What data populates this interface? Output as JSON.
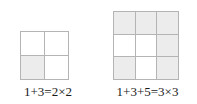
{
  "figure": {
    "colors": {
      "shaded_cell": "#ececec",
      "empty_cell": "#ffffff",
      "grid_line": "#b4b4b4",
      "text": "#1a1a1a",
      "background": "#ffffff"
    },
    "panels": [
      {
        "id": "panel-2x2",
        "name": "two-by-two-square",
        "rows": 2,
        "cols": 2,
        "cells": [
          {
            "row": 1,
            "col": 1,
            "shaded": false
          },
          {
            "row": 1,
            "col": 2,
            "shaded": false
          },
          {
            "row": 2,
            "col": 1,
            "shaded": true
          },
          {
            "row": 2,
            "col": 2,
            "shaded": false
          }
        ],
        "shaded_count": 1,
        "total_cells": 4,
        "caption": "1+3=2×2",
        "equation": {
          "terms": [
            1,
            3
          ],
          "sum": 4,
          "factor": 2,
          "product_text": "2×2"
        }
      },
      {
        "id": "panel-3x3",
        "name": "three-by-three-square",
        "rows": 3,
        "cols": 3,
        "cells": [
          {
            "row": 1,
            "col": 1,
            "shaded": true
          },
          {
            "row": 1,
            "col": 2,
            "shaded": true
          },
          {
            "row": 1,
            "col": 3,
            "shaded": true
          },
          {
            "row": 2,
            "col": 1,
            "shaded": false
          },
          {
            "row": 2,
            "col": 2,
            "shaded": false
          },
          {
            "row": 2,
            "col": 3,
            "shaded": true
          },
          {
            "row": 3,
            "col": 1,
            "shaded": true
          },
          {
            "row": 3,
            "col": 2,
            "shaded": false
          },
          {
            "row": 3,
            "col": 3,
            "shaded": true
          }
        ],
        "shaded_count": 6,
        "total_cells": 9,
        "caption": "1+3+5=3×3",
        "equation": {
          "terms": [
            1,
            3,
            5
          ],
          "sum": 9,
          "factor": 3,
          "product_text": "3×3"
        }
      }
    ]
  },
  "chart_data": {
    "type": "table",
    "categories": [
      "1+3=2×2",
      "1+3+5=3×3"
    ],
    "values": [
      4,
      9
    ],
    "series": [
      {
        "name": "shaded cells",
        "values": [
          1,
          6
        ]
      },
      {
        "name": "total cells",
        "values": [
          4,
          9
        ]
      }
    ],
    "xlabel": "",
    "ylabel": "",
    "annotations": [
      "1+3=2×2",
      "1+3+5=3×3"
    ]
  }
}
